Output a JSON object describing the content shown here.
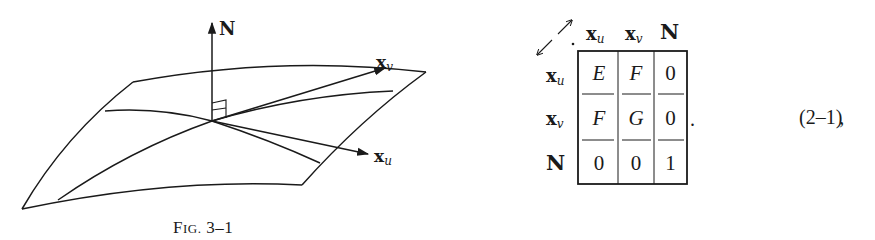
{
  "figure": {
    "caption_prefix": "F",
    "caption_smallcaps": "IG.",
    "caption_number": "3–1",
    "labels": {
      "normal": "N",
      "xv_base": "x",
      "xv_sub": "v",
      "xu_base": "x",
      "xu_sub": "u"
    }
  },
  "table": {
    "corner_symbol": "double-diagonal-arrow",
    "column_headers": [
      {
        "base": "x",
        "sub": "u"
      },
      {
        "base": "x",
        "sub": "v"
      },
      {
        "base": "N",
        "sub": ""
      }
    ],
    "row_headers": [
      {
        "base": "x",
        "sub": "u"
      },
      {
        "base": "x",
        "sub": "v"
      },
      {
        "base": "N",
        "sub": ""
      }
    ],
    "cells": [
      [
        "E",
        "F",
        "0"
      ],
      [
        "F",
        "G",
        "0"
      ],
      [
        "0",
        "0",
        "1"
      ]
    ],
    "trailing_punct": "."
  },
  "equation": {
    "number": "(2–1)",
    "trailing_punct": ","
  }
}
